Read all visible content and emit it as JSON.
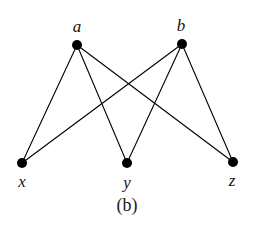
{
  "figure": {
    "caption": "(b)",
    "background_color": "#ffffff",
    "ink_color": "#000000",
    "label_color": "#141414"
  },
  "chart_data": {
    "type": "diagram",
    "diagram_kind": "bipartite-graph",
    "title": "(b)",
    "node_radius": 5,
    "edge_width": 1.1,
    "nodes": [
      {
        "id": "a",
        "label": "a",
        "x": 77,
        "y": 45,
        "part": "top",
        "label_x": 77,
        "label_y": 26,
        "degree": 3
      },
      {
        "id": "b",
        "label": "b",
        "x": 182,
        "y": 44,
        "part": "top",
        "label_x": 181,
        "label_y": 25,
        "degree": 3
      },
      {
        "id": "x",
        "label": "x",
        "x": 22,
        "y": 163,
        "part": "bottom",
        "label_x": 22,
        "label_y": 181,
        "degree": 2
      },
      {
        "id": "y",
        "label": "y",
        "x": 127,
        "y": 163,
        "part": "bottom",
        "label_x": 127,
        "label_y": 182,
        "degree": 2
      },
      {
        "id": "z",
        "label": "z",
        "x": 233,
        "y": 162,
        "part": "bottom",
        "label_x": 232,
        "label_y": 180,
        "degree": 2
      }
    ],
    "edges": [
      {
        "from": "a",
        "to": "x"
      },
      {
        "from": "a",
        "to": "y"
      },
      {
        "from": "a",
        "to": "z"
      },
      {
        "from": "b",
        "to": "x"
      },
      {
        "from": "b",
        "to": "y"
      },
      {
        "from": "b",
        "to": "z"
      }
    ],
    "edge_count": 6,
    "node_count": 5
  }
}
